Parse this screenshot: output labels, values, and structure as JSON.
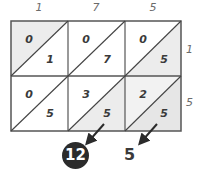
{
  "diagram": {
    "type": "lattice-multiplication",
    "multiplicand_digits": [
      "1",
      "7",
      "5"
    ],
    "multiplier_digits": [
      "1",
      "5"
    ],
    "cells": [
      [
        {
          "tens": "0",
          "ones": "1"
        },
        {
          "tens": "0",
          "ones": "7"
        },
        {
          "tens": "0",
          "ones": "5"
        }
      ],
      [
        {
          "tens": "0",
          "ones": "5"
        },
        {
          "tens": "3",
          "ones": "5"
        },
        {
          "tens": "2",
          "ones": "5"
        }
      ]
    ],
    "diagonal_results": {
      "highlighted": "12",
      "plain": "5"
    },
    "colors": {
      "grid_line": "#555555",
      "shade": "#ececec",
      "label": "#6b6b6b",
      "digit": "#3a3a3a",
      "circle": "#2b2b2b"
    }
  }
}
